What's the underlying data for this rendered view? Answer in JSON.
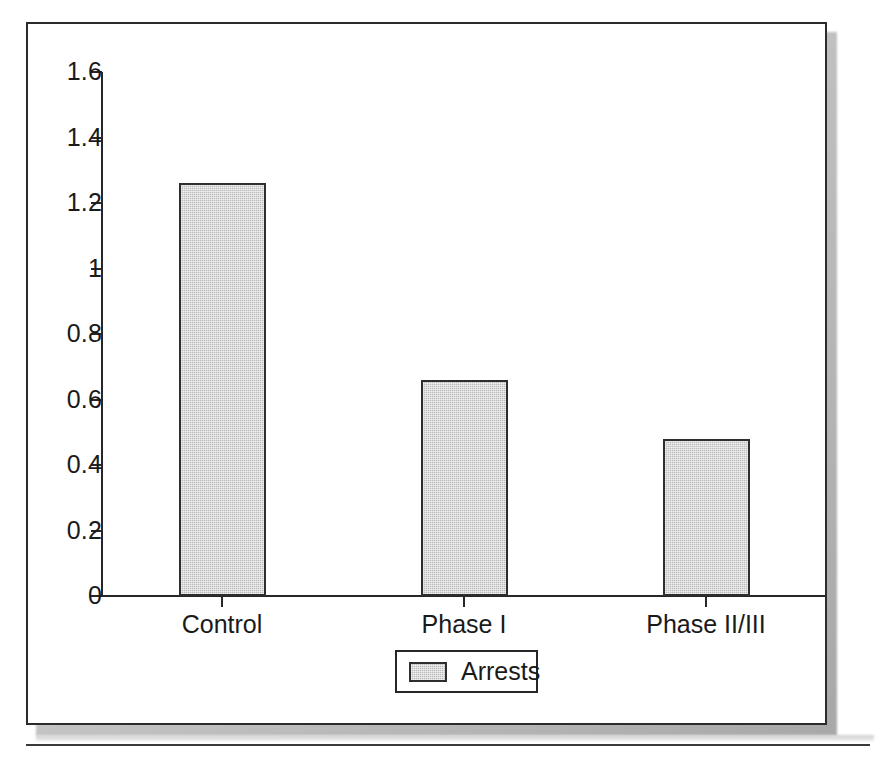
{
  "figure": {
    "background_color": "#ffffff",
    "frame_color": "#2b2b2b",
    "has_drop_shadow": true,
    "has_bottom_rule": true
  },
  "chart_data": {
    "type": "bar",
    "title": "",
    "xlabel": "",
    "ylabel": "",
    "categories": [
      "Control",
      "Phase I",
      "Phase II/III"
    ],
    "values": [
      1.26,
      0.66,
      0.48
    ],
    "series": [
      {
        "name": "Arrests",
        "values": [
          1.26,
          0.66,
          0.48
        ],
        "color": "#bcbcbc",
        "edge_color": "#2e2e2e"
      }
    ],
    "ylim": [
      0,
      1.6
    ],
    "ytick_labels": [
      "1.6",
      "1.4",
      "1.2",
      "1",
      "0.8",
      "0.6",
      "0.4",
      "0.2",
      "0"
    ],
    "ytick_values": [
      1.6,
      1.4,
      1.2,
      1.0,
      0.8,
      0.6,
      0.4,
      0.2,
      0
    ],
    "grid": false,
    "legend": {
      "position": "bottom-center",
      "entries": [
        {
          "label": "Arrests",
          "swatch_color": "#bcbcbc"
        }
      ]
    }
  }
}
